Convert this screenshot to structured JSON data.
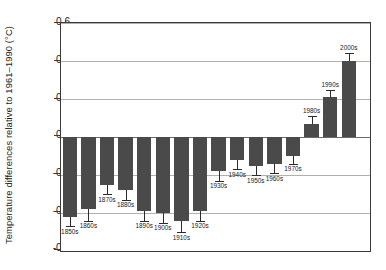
{
  "chart_data": {
    "type": "bar",
    "title": "",
    "xlabel": "",
    "ylabel": "Temperature differences relative to 1961–1990 (°C)",
    "ylim": [
      -0.6,
      0.6
    ],
    "ytick_labels": [
      "0.6",
      "0.4",
      "0.2",
      "0.0",
      "-0.2",
      "-0.4",
      "-0.6"
    ],
    "ytick_values": [
      0.6,
      0.4,
      0.2,
      0.0,
      -0.2,
      -0.4,
      -0.6
    ],
    "grid": "horizontal",
    "legend": "none",
    "bar_color": "#4a4a4a",
    "categories": [
      "1850s",
      "1860s",
      "1870s",
      "1880s",
      "1890s",
      "1900s",
      "1910s",
      "1920s",
      "1930s",
      "1940s",
      "1950s",
      "1960s",
      "1970s",
      "1980s",
      "1990s",
      "2000s"
    ],
    "values": [
      -0.42,
      -0.38,
      -0.25,
      -0.28,
      -0.39,
      -0.4,
      -0.44,
      -0.39,
      -0.18,
      -0.12,
      -0.15,
      -0.14,
      -0.1,
      0.07,
      0.21,
      0.4
    ],
    "error_low": [
      -0.47,
      -0.44,
      -0.3,
      -0.33,
      -0.44,
      -0.45,
      -0.5,
      -0.44,
      -0.23,
      -0.17,
      -0.2,
      -0.19,
      -0.14,
      0.03,
      0.17,
      0.36
    ],
    "error_high": [
      -0.37,
      -0.32,
      -0.2,
      -0.23,
      -0.34,
      -0.35,
      -0.38,
      -0.34,
      -0.13,
      -0.07,
      -0.1,
      -0.09,
      -0.06,
      0.11,
      0.25,
      0.44
    ],
    "series": [
      {
        "name": "Decadal temperature anomaly",
        "values": [
          -0.42,
          -0.38,
          -0.25,
          -0.28,
          -0.39,
          -0.4,
          -0.44,
          -0.39,
          -0.18,
          -0.12,
          -0.15,
          -0.14,
          -0.1,
          0.07,
          0.21,
          0.4
        ]
      }
    ]
  }
}
